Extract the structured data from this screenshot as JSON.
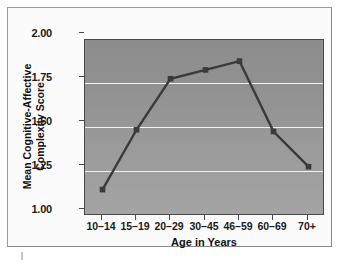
{
  "chart_data": {
    "type": "line",
    "title": "",
    "xlabel": "Age in Years",
    "ylabel": "Mean Cognitive-Affective\nComplexity Score",
    "ylabel_line1": "Mean Cognitive-Affective",
    "ylabel_line2": "Complexity Score",
    "categories": [
      "10–14",
      "15–19",
      "20–29",
      "30–45",
      "46–59",
      "60–69",
      "70+"
    ],
    "values": [
      1.15,
      1.49,
      1.78,
      1.83,
      1.88,
      1.48,
      1.28
    ],
    "ylim": [
      1.0,
      2.0
    ],
    "yticks": [
      "1.00",
      "1.25",
      "1.50",
      "1.75",
      "2.00"
    ],
    "ytick_values": [
      1.0,
      1.25,
      1.5,
      1.75,
      2.0
    ],
    "gridlines": [
      1.25,
      1.5,
      1.75
    ],
    "grid": true,
    "legend": "none",
    "series_color": "#3a3a3a",
    "marker": "square",
    "panel_background": "#999999",
    "gridline_color": "#f0f0f0"
  }
}
